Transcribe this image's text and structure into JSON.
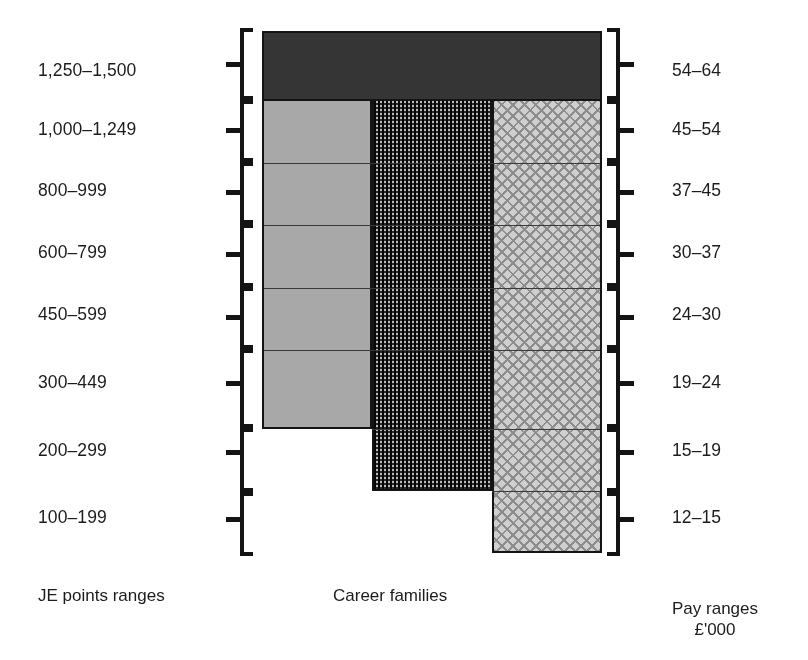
{
  "figure": {
    "type": "stepped-column-diagram",
    "left_axis_caption": "JE points ranges",
    "center_caption": "Career families",
    "right_axis_caption_line1": "Pay ranges",
    "right_axis_caption_line2": "£'000"
  },
  "bands": [
    {
      "je_points": "1,250–1,500",
      "pay_range": "54–64",
      "columns_filled": 3,
      "top_band": true
    },
    {
      "je_points": "1,000–1,249",
      "pay_range": "45–54",
      "columns_filled": 3,
      "top_band": false
    },
    {
      "je_points": "800–999",
      "pay_range": "37–45",
      "columns_filled": 3,
      "top_band": false
    },
    {
      "je_points": "600–799",
      "pay_range": "30–37",
      "columns_filled": 3,
      "top_band": false
    },
    {
      "je_points": "450–599",
      "pay_range": "24–30",
      "columns_filled": 3,
      "top_band": false
    },
    {
      "je_points": "300–449",
      "pay_range": "19–24",
      "columns_filled": 3,
      "top_band": false
    },
    {
      "je_points": "200–299",
      "pay_range": "15–19",
      "columns_filled": 2,
      "top_band": false
    },
    {
      "je_points": "100–199",
      "pay_range": "12–15",
      "columns_filled": 1,
      "top_band": false
    }
  ],
  "left_labels": [
    "1,250–1,500",
    "1,000–1,249",
    "800–999",
    "600–799",
    "450–599",
    "300–449",
    "200–299",
    "100–199"
  ],
  "right_labels": [
    "54–64",
    "45–54",
    "37–45",
    "30–37",
    "24–30",
    "19–24",
    "15–19",
    "12–15"
  ],
  "columns": [
    {
      "name": "career-family-1",
      "fill": "solid-grey",
      "color": "#a8a8a8",
      "extends_to_band": 6
    },
    {
      "name": "career-family-2",
      "fill": "dense-checker",
      "color": "#6b6b6b",
      "extends_to_band": 7
    },
    {
      "name": "career-family-3",
      "fill": "diamond-lattice",
      "color": "#cfcfcf",
      "extends_to_band": 8
    }
  ],
  "colors": {
    "top_band": "#353535",
    "outline": "#141414",
    "text": "#1c1c1c",
    "background": "#ffffff"
  }
}
